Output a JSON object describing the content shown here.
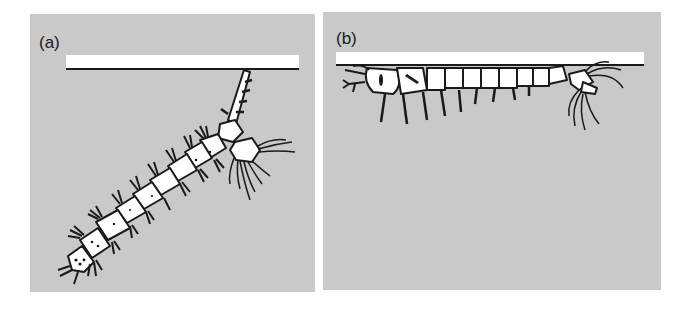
{
  "figure": {
    "panels": [
      {
        "id": "a",
        "label": "(a)",
        "description": "larva hanging diagonally from water surface by siphon"
      },
      {
        "id": "b",
        "label": "(b)",
        "description": "larva lying horizontally just beneath water surface"
      }
    ],
    "colors": {
      "background": "#c9c9c9",
      "surface": "#ffffff",
      "outline": "#1a1a1a"
    }
  }
}
